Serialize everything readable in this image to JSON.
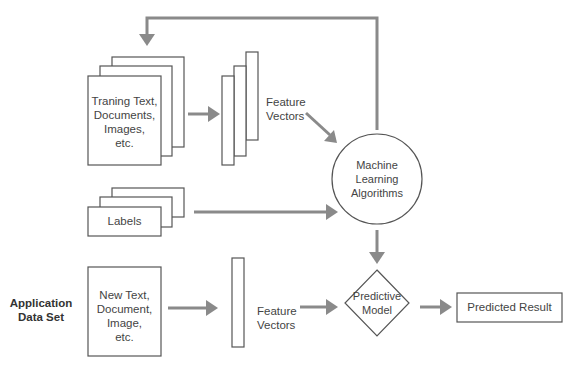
{
  "diagram": {
    "training_stack": {
      "label_lines": [
        "Traning Text,",
        "Documents,",
        "Images,",
        "etc."
      ]
    },
    "training_feature_vectors": {
      "label_lines": [
        "Feature",
        "Vectors"
      ]
    },
    "ml_algorithms": {
      "label_lines": [
        "Machine",
        "Learning",
        "Algorithms"
      ]
    },
    "labels_stack": {
      "label": "Labels"
    },
    "application_data_set": {
      "label_lines": [
        "Application",
        "Data Set"
      ]
    },
    "new_data_box": {
      "label_lines": [
        "New Text,",
        "Document,",
        "Image,",
        "etc."
      ]
    },
    "new_feature_vectors": {
      "label_lines": [
        "Feature",
        "Vectors"
      ]
    },
    "predictive_model": {
      "label_lines": [
        "Predictive",
        "Model"
      ]
    },
    "predicted_result": {
      "label": "Predicted Result"
    },
    "colors": {
      "connector": "#8a8a8a",
      "shape_stroke": "#555555",
      "text": "#444444",
      "background": "#ffffff"
    }
  }
}
